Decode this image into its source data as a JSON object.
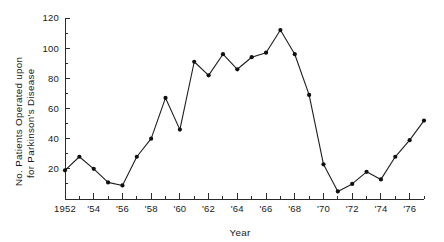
{
  "chart_data": {
    "type": "line",
    "title": "",
    "subtitle": "",
    "xlabel": "Year",
    "ylabel": "No. Patients Operated upon for Parkinson's Disease",
    "ylabel_line1": "No. Patients Operated upon",
    "ylabel_line2": "for Parkinson's Disease",
    "x": [
      1952,
      1953,
      1954,
      1955,
      1956,
      1957,
      1958,
      1959,
      1960,
      1961,
      1962,
      1963,
      1964,
      1965,
      1966,
      1967,
      1968,
      1969,
      1970,
      1971,
      1972,
      1973,
      1974,
      1975,
      1976,
      1977
    ],
    "values": [
      19,
      28,
      20,
      11,
      9,
      28,
      40,
      67,
      46,
      91,
      82,
      96,
      86,
      94,
      97,
      112,
      96,
      69,
      23,
      5,
      10,
      18,
      13,
      28,
      39,
      52
    ],
    "series": [
      {
        "name": "No. Patients Operated upon for Parkinson's Disease",
        "values": [
          19,
          28,
          20,
          11,
          9,
          28,
          40,
          67,
          46,
          91,
          82,
          96,
          86,
          94,
          97,
          112,
          96,
          69,
          23,
          5,
          10,
          18,
          13,
          28,
          39,
          52
        ]
      }
    ],
    "xlim": [
      1952,
      1977
    ],
    "ylim": [
      0,
      120
    ],
    "y_major_ticks": [
      0,
      20,
      40,
      60,
      80,
      100,
      120
    ],
    "y_major_tick_labels": [
      "",
      "20",
      "40",
      "60",
      "80",
      "100",
      "120"
    ],
    "y_minor_ticks": [
      10,
      30,
      50,
      70,
      90,
      110
    ],
    "x_major_ticks": [
      1952,
      1954,
      1956,
      1958,
      1960,
      1962,
      1964,
      1966,
      1968,
      1970,
      1972,
      1974,
      1976
    ],
    "x_major_tick_labels": [
      "1952",
      "'54",
      "'56",
      "'58",
      "'60",
      "'62",
      "'64",
      "'66",
      "'68",
      "'70",
      "'72",
      "'74",
      "'76"
    ],
    "x_minor_ticks": [
      1953,
      1955,
      1957,
      1959,
      1961,
      1963,
      1965,
      1967,
      1969,
      1971,
      1973,
      1975,
      1977
    ],
    "grid": false,
    "legend": false,
    "legend_position": "none",
    "marker": "filled-circle",
    "line_color": "#1e1e1e",
    "marker_color": "#101010",
    "axis_color": "#2b2b2b",
    "background_color": "#ffffff"
  }
}
